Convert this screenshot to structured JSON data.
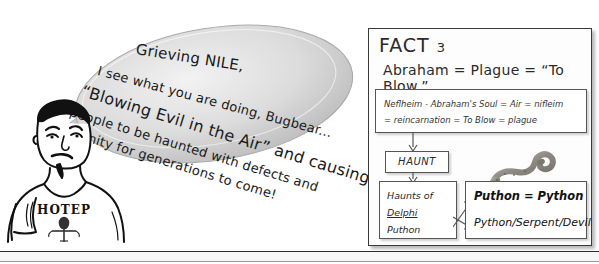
{
  "speech": {
    "lines": [
      "Grieving NILE,",
      "I see what you are doing, Bugbear...",
      "“Blowing Evil in the Air” and causing the",
      "people to be haunted with defects and",
      "disunity for generations to come!"
    ]
  },
  "character": {
    "shirt_text": "HOTEP",
    "shirt_symbol": "ankh"
  },
  "fact_panel": {
    "title": "FACT",
    "number": "3",
    "equation": "Abraham = Plague = “To Blow.”",
    "soul_box": {
      "line1": "Neflheim - Abraham's Soul = Air = nifleim",
      "line2": "= reincarnation = To Blow = plague"
    },
    "haunt_box": {
      "label": "HAUNT"
    },
    "haunts_box": {
      "line1": "Haunts of",
      "line2": "Delphi",
      "line3": "Puthon"
    },
    "python_box": {
      "line1": "Puthon = Python",
      "line2": "Python/Serpent/Devil"
    },
    "snake_image_alt": "serpent"
  },
  "colors": {
    "ink": "#1a1a1a",
    "panel_border": "#3a3a3a",
    "bubble_fill": "#d8d8d8",
    "page_background": "#ffffff"
  }
}
